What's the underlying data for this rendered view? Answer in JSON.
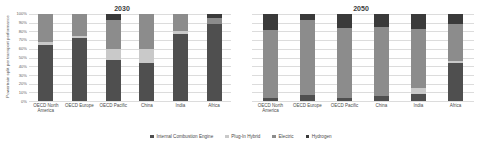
{
  "axis_title": "Powertrain split per transport performance",
  "yticks": [
    "100%",
    "90%",
    "80%",
    "70%",
    "60%",
    "50%",
    "40%",
    "30%",
    "20%",
    "10%",
    "0%"
  ],
  "legend": {
    "items": [
      {
        "label": "Internal Combustion Engine",
        "color": "#4f4f4f"
      },
      {
        "label": "Plug-In Hybrid",
        "color": "#c9c9c9"
      },
      {
        "label": "Electric",
        "color": "#8c8c8c"
      },
      {
        "label": "Hydrogen",
        "color": "#3a3a3a"
      }
    ]
  },
  "chart_data": [
    {
      "type": "bar",
      "title": "2030",
      "stacked": true,
      "xlabel": "",
      "ylabel": "Powertrain split per transport performance",
      "ylim": [
        0,
        100
      ],
      "grid": true,
      "legend_position": "bottom",
      "categories": [
        "OECD North America",
        "OECD Europe",
        "OECD Pacific",
        "China",
        "India",
        "Africa"
      ],
      "series": [
        {
          "name": "Internal Combustion Engine",
          "color": "#4f4f4f",
          "values": [
            64,
            72,
            47,
            44,
            77,
            88
          ]
        },
        {
          "name": "Plug-In Hybrid",
          "color": "#c9c9c9",
          "values": [
            4,
            3,
            13,
            16,
            4,
            0
          ]
        },
        {
          "name": "Electric",
          "color": "#8c8c8c",
          "values": [
            32,
            25,
            33,
            40,
            19,
            8
          ]
        },
        {
          "name": "Hydrogen",
          "color": "#3a3a3a",
          "values": [
            0,
            0,
            7,
            0,
            0,
            4
          ]
        }
      ]
    },
    {
      "type": "bar",
      "title": "2050",
      "stacked": true,
      "xlabel": "",
      "ylabel": "Powertrain split per transport performance",
      "ylim": [
        0,
        100
      ],
      "grid": true,
      "legend_position": "bottom",
      "categories": [
        "OECD North America",
        "OECD Europe",
        "OECD Pacific",
        "China",
        "India",
        "Africa"
      ],
      "series": [
        {
          "name": "Internal Combustion Engine",
          "color": "#4f4f4f",
          "values": [
            4,
            7,
            4,
            6,
            8,
            44
          ]
        },
        {
          "name": "Plug-In Hybrid",
          "color": "#c9c9c9",
          "values": [
            0,
            0,
            0,
            0,
            7,
            2
          ]
        },
        {
          "name": "Electric",
          "color": "#8c8c8c",
          "values": [
            78,
            86,
            80,
            79,
            68,
            42
          ]
        },
        {
          "name": "Hydrogen",
          "color": "#3a3a3a",
          "values": [
            18,
            7,
            16,
            15,
            17,
            12
          ]
        }
      ]
    }
  ]
}
